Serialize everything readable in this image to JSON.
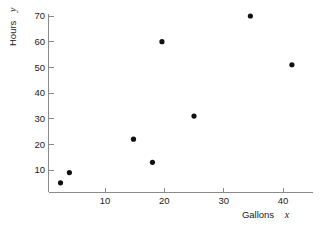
{
  "chart_data": {
    "type": "scatter",
    "title": "",
    "xlabel": "Gallons",
    "xlabel_var": "x",
    "ylabel": "Hours",
    "ylabel_var": "y",
    "xlim": [
      0,
      44.5
    ],
    "ylim": [
      0,
      73
    ],
    "grid": false,
    "legend": null,
    "xticks": [
      10,
      20,
      30,
      40
    ],
    "xticklabels": [
      "10",
      "20",
      "30",
      "40"
    ],
    "yticks": [
      10,
      20,
      30,
      40,
      50,
      60,
      70
    ],
    "yticklabels": [
      "10",
      "20",
      "30",
      "40",
      "50",
      "60",
      "70"
    ],
    "marker": "filled-circle",
    "marker_color": "#111111",
    "axis_color": "#8a8a8a",
    "points": [
      {
        "x": 2.5,
        "y": 5
      },
      {
        "x": 4.0,
        "y": 9
      },
      {
        "x": 14.8,
        "y": 22
      },
      {
        "x": 18.0,
        "y": 13
      },
      {
        "x": 19.6,
        "y": 60
      },
      {
        "x": 25.0,
        "y": 31
      },
      {
        "x": 34.5,
        "y": 70
      },
      {
        "x": 41.5,
        "y": 51
      }
    ]
  }
}
